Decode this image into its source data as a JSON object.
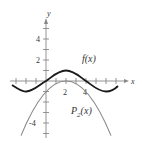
{
  "figure": {
    "axes": {
      "x_label": "x",
      "y_label": "y",
      "x_tick_labels": [
        "2",
        "4"
      ],
      "y_tick_labels": [
        "4",
        "2",
        "-4"
      ],
      "x_range": [
        -4.5,
        8.5
      ],
      "y_range": [
        -6,
        6.5
      ]
    },
    "curves": [
      {
        "name": "f(x)",
        "label": "f(x)",
        "color": "#1a1a1a",
        "description": "wave with maximum 1 at x=2, zeros at x=0 and x=4"
      },
      {
        "name": "P2(x)",
        "label_main": "P",
        "label_sub": "2",
        "label_tail": "(x)",
        "color": "#8a8a8a",
        "description": "downward parabola through (0,0), (2,1), (4,0)"
      }
    ]
  }
}
